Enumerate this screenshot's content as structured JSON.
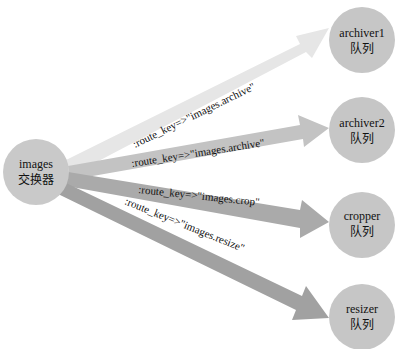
{
  "diagram": {
    "exchange": {
      "name": "images",
      "type_label": "交换器",
      "cx": 36,
      "cy": 172,
      "r": 33,
      "color": "#c9c9c9"
    },
    "queues": [
      {
        "name": "archiver1",
        "type_label": "队列",
        "cx": 362,
        "cy": 40,
        "r": 33,
        "color": "#c6c6c6"
      },
      {
        "name": "archiver2",
        "type_label": "队列",
        "cx": 362,
        "cy": 130,
        "r": 33,
        "color": "#c6c6c6"
      },
      {
        "name": "cropper",
        "type_label": "队列",
        "cx": 362,
        "cy": 225,
        "r": 33,
        "color": "#c6c6c6"
      },
      {
        "name": "resizer",
        "type_label": "队列",
        "cx": 362,
        "cy": 317,
        "r": 33,
        "color": "#c6c6c6"
      }
    ],
    "bindings": [
      {
        "label": ":route_key=>\"images.archive\"",
        "color": "#e4e4e4"
      },
      {
        "label": ":route_key=>\"images.archive\"",
        "color": "#c2c2c2"
      },
      {
        "label": ":route_key=>\"images.crop\"",
        "color": "#a9a9a9"
      },
      {
        "label": ":route_key=>\"images.resize\"",
        "color": "#9f9f9f"
      }
    ]
  }
}
